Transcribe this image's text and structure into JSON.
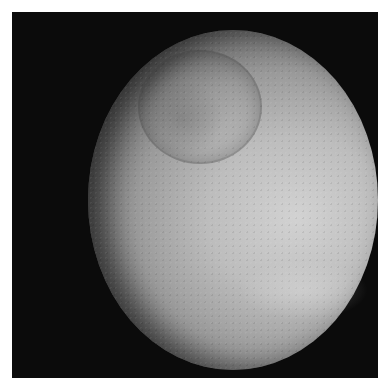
{
  "image": {
    "subject": "cratered moon",
    "background_color": "#0b0b0b",
    "border_color": "#ffffff",
    "surface_colors": {
      "bright": "#d2d2d2",
      "mid": "#9a9a9a",
      "shadow": "#1e1e1e"
    },
    "features": [
      "large impact crater upper-left",
      "bright band lower-right",
      "terminator shadow on left limb"
    ]
  }
}
